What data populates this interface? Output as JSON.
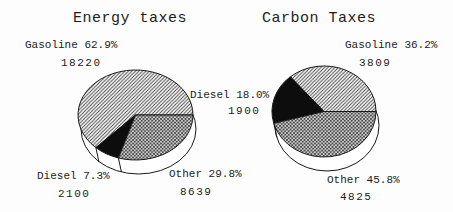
{
  "palette": {
    "paper": "#fdfdfd",
    "ink": "#1a1a1a",
    "slice_black": "#0d0d0d",
    "hatch_line": "#3d3d3d"
  },
  "chart_data": [
    {
      "type": "pie",
      "title": "Energy taxes",
      "categories": [
        "Gasoline",
        "Diesel",
        "Other"
      ],
      "values": [
        18220,
        2100,
        8639
      ],
      "percentages": [
        62.9,
        7.3,
        29.8
      ],
      "slice_labels": [
        "Gasoline 62.9%",
        "Diesel 7.3%",
        "Other 29.8%"
      ],
      "value_labels": [
        "18220",
        "2100",
        "8639"
      ],
      "slice_patterns": [
        "diagonal-hatch",
        "solid-black",
        "crosshatch"
      ],
      "start_angle_deg": 0,
      "direction": "counterclockwise",
      "style": "3d-pie-with-white-rim"
    },
    {
      "type": "pie",
      "title": "Carbon Taxes",
      "categories": [
        "Gasoline",
        "Diesel",
        "Other"
      ],
      "values": [
        3809,
        1900,
        4825
      ],
      "percentages": [
        36.2,
        18.0,
        45.8
      ],
      "slice_labels": [
        "Gasoline 36.2%",
        "Diesel 18.0%",
        "Other 45.8%"
      ],
      "value_labels": [
        "3809",
        "1900",
        "4825"
      ],
      "slice_patterns": [
        "diagonal-hatch",
        "solid-black",
        "crosshatch"
      ],
      "start_angle_deg": 0,
      "direction": "counterclockwise",
      "style": "3d-pie-with-white-rim"
    }
  ],
  "layout": {
    "pies": [
      {
        "cx": 135.5,
        "cy": 115,
        "rx": 57.5,
        "ry": 45,
        "depth": 14,
        "base_dx": 3,
        "title_pos": [
          73,
          10
        ],
        "label_pos": [
          [
            25,
            39
          ],
          [
            37,
            170
          ],
          [
            169,
            168
          ]
        ],
        "value_pos": [
          [
            61,
            57
          ],
          [
            58,
            188
          ],
          [
            180,
            186
          ]
        ]
      },
      {
        "cx": 324,
        "cy": 111.5,
        "rx": 52,
        "ry": 45.5,
        "depth": 14,
        "base_dx": 3,
        "title_pos": [
          262,
          10
        ],
        "label_pos": [
          [
            345,
            39
          ],
          [
            190,
            89
          ],
          [
            327,
            174
          ]
        ],
        "value_pos": [
          [
            359,
            57
          ],
          [
            228,
            105
          ],
          [
            340,
            191
          ]
        ]
      }
    ]
  }
}
